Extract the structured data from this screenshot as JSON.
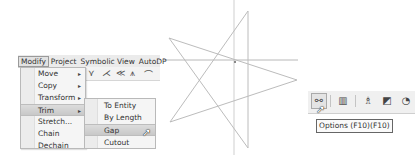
{
  "menubar": {
    "items": [
      {
        "label": "Modify",
        "active": true
      },
      {
        "label": "Project"
      },
      {
        "label": "Symbolic View"
      },
      {
        "label": "AutoDP"
      }
    ]
  },
  "modify_menu": {
    "items": [
      {
        "label": "Move",
        "submenu": true
      },
      {
        "label": "Copy",
        "submenu": true
      },
      {
        "label": "Transform",
        "submenu": true
      },
      {
        "label": "Trim",
        "submenu": true,
        "highlighted": true
      },
      {
        "label": "Stretch..."
      },
      {
        "label": "Chain"
      },
      {
        "label": "Dechain"
      }
    ],
    "arrow": "▸"
  },
  "trim_submenu": {
    "items": [
      {
        "label": "To Entity"
      },
      {
        "label": "By Length"
      },
      {
        "label": "Gap",
        "highlighted": true
      },
      {
        "label": "Cutout"
      }
    ]
  },
  "toolbar_icons": [
    "⋎",
    "⋌",
    "≪",
    "⩚",
    "⌒"
  ],
  "canvas": {
    "star_points": [
      [
        248,
        11
      ],
      [
        170,
        122
      ],
      [
        297,
        80
      ],
      [
        169,
        38
      ],
      [
        248,
        148
      ]
    ],
    "crosshair": {
      "x": 234,
      "y": 60
    },
    "line_color": "#c4c4c4"
  },
  "right_toolbar": {
    "buttons": [
      {
        "name": "options",
        "glyph": "⚯"
      },
      {
        "name": "grid",
        "glyph": "▥"
      },
      {
        "name": "paint",
        "glyph": "♗"
      },
      {
        "name": "zoom-window",
        "glyph": "◩"
      },
      {
        "name": "partial",
        "glyph": "◔"
      }
    ],
    "tooltip": "Options (F10)(F10)"
  },
  "cursor": "➚"
}
